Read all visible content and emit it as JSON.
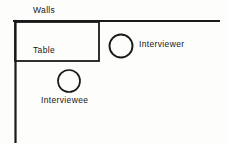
{
  "diagram": {
    "stroke_color": "#1a1a1a",
    "background_color": "#fdfdfc",
    "labels": {
      "walls": "Walls",
      "table": "Table",
      "interviewer": "Interviewer",
      "interviewee": "Interviewee"
    },
    "shapes": {
      "top_wall": {
        "name": "top-wall-line",
        "x1": 14,
        "y1": 21,
        "x2": 219,
        "y2": 21
      },
      "left_wall": {
        "name": "left-wall-line",
        "x1": 15,
        "y1": 21,
        "x2": 15,
        "y2": 142
      },
      "table": {
        "name": "table-rectangle",
        "x": 14,
        "y": 21,
        "width": 85,
        "height": 40
      },
      "interviewer_seat": {
        "name": "interviewer-circle",
        "cx": 121,
        "cy": 46,
        "r": 11.5
      },
      "interviewee_seat": {
        "name": "interviewee-circle",
        "cx": 69,
        "cy": 81,
        "r": 11
      }
    }
  }
}
